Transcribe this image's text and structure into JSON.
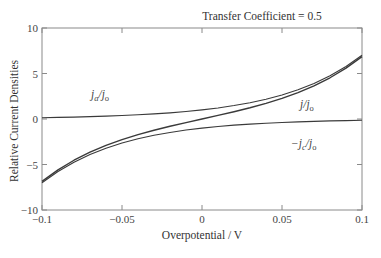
{
  "chart_data": {
    "type": "line",
    "title": "Transfer Coefficient = 0.5",
    "xlabel": "Overpotential / V",
    "ylabel": "Relative Current Densities",
    "xlim": [
      -0.1,
      0.1
    ],
    "ylim": [
      -10,
      10
    ],
    "xticks": [
      -0.1,
      -0.05,
      0,
      0.05,
      0.1
    ],
    "xtick_labels": [
      "−0.1",
      "−0.05",
      "0",
      "0.05",
      "0.1"
    ],
    "yticks": [
      -10,
      -5,
      0,
      5,
      10
    ],
    "ytick_labels": [
      "−10",
      "−5",
      "0",
      "5",
      "10"
    ],
    "grid": false,
    "legend": "none (inline curve labels)",
    "x": [
      -0.1,
      -0.09,
      -0.08,
      -0.07,
      -0.06,
      -0.05,
      -0.04,
      -0.03,
      -0.02,
      -0.01,
      0,
      0.01,
      0.02,
      0.03,
      0.04,
      0.05,
      0.06,
      0.07,
      0.08,
      0.09,
      0.1
    ],
    "series": [
      {
        "name": "j_a/j_o",
        "label_main": "j",
        "label_sub": "a",
        "label_rest": "/j",
        "label_sub2": "o",
        "values": [
          0.143,
          0.174,
          0.211,
          0.256,
          0.311,
          0.378,
          0.459,
          0.558,
          0.678,
          0.823,
          1.0,
          1.215,
          1.476,
          1.793,
          2.178,
          2.645,
          3.214,
          3.904,
          4.742,
          5.761,
          6.998
        ]
      },
      {
        "name": "j/j_o",
        "label_main": "j",
        "label_sub": "",
        "label_rest": "/j",
        "label_sub2": "o",
        "values": [
          -6.855,
          -5.587,
          -4.531,
          -3.648,
          -2.902,
          -2.267,
          -1.719,
          -1.235,
          -0.798,
          -0.392,
          0.0,
          0.392,
          0.798,
          1.235,
          1.719,
          2.267,
          2.902,
          3.648,
          4.531,
          5.587,
          6.855
        ]
      },
      {
        "name": "-j_c/j_o",
        "label_main": "−j",
        "label_sub": "c",
        "label_rest": "/j",
        "label_sub2": "o",
        "values": [
          -6.998,
          -5.761,
          -4.742,
          -3.904,
          -3.214,
          -2.645,
          -2.178,
          -1.793,
          -1.476,
          -1.215,
          -1.0,
          -0.823,
          -0.678,
          -0.558,
          -0.459,
          -0.378,
          -0.311,
          -0.256,
          -0.211,
          -0.174,
          -0.143
        ]
      }
    ],
    "colors": {
      "axis": "#8a8a8a",
      "curve": "#3a3a3a",
      "text": "#333333"
    }
  }
}
